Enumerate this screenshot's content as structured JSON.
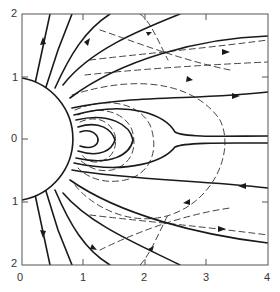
{
  "figure": {
    "x_ticks": [
      "0",
      "1",
      "2",
      "3",
      "4"
    ],
    "y_ticks": [
      "2",
      "1",
      "0",
      "1",
      "2"
    ],
    "xlim": [
      0,
      4
    ],
    "ylim": [
      -2,
      2
    ],
    "sphere_radius": 1,
    "colors": {
      "line": "#1a1a1a",
      "dashed": "#444444",
      "frame": "#555555"
    }
  }
}
